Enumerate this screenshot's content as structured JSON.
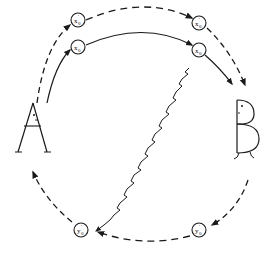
{
  "diagram": {
    "ink_color": "#1a1a1a",
    "background": "#ffffff",
    "actors": [
      {
        "id": "A",
        "label": "A",
        "position": "left"
      },
      {
        "id": "B",
        "label": "B",
        "position": "right"
      }
    ],
    "nodes": [
      {
        "id": "xprime_top_left",
        "main": "x",
        "sup": "'",
        "sub": "0",
        "position": "top-left"
      },
      {
        "id": "x_top_left",
        "main": "x",
        "sup": "",
        "sub": "0",
        "position": "top-left"
      },
      {
        "id": "xprime_top_right",
        "main": "x",
        "sup": "'",
        "sub": "0",
        "position": "top-right"
      },
      {
        "id": "x_top_right",
        "main": "x",
        "sup": "",
        "sub": "0",
        "position": "top-right"
      },
      {
        "id": "yprime_bottom_left",
        "main": "y",
        "sup": "'",
        "sub": "0",
        "position": "bottom-left"
      },
      {
        "id": "yprime_bottom_right",
        "main": "y",
        "sup": "'",
        "sub": "0",
        "position": "bottom-right"
      }
    ],
    "edges": [
      {
        "from": "A",
        "to": "B",
        "style": "dashed",
        "path": "outer top arc via x'0 nodes"
      },
      {
        "from": "A",
        "to": "B",
        "style": "solid",
        "path": "inner top arc via x0 nodes"
      },
      {
        "from": "B",
        "to": "A",
        "style": "dashed",
        "path": "bottom arc via y'0 nodes"
      },
      {
        "from": "x_top_right",
        "to": "yprime_bottom_left",
        "style": "wavy",
        "path": "diagonal wavy line"
      }
    ]
  }
}
